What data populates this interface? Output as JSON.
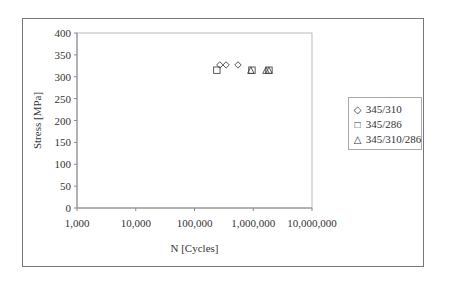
{
  "chart_data": {
    "type": "scatter",
    "title": "",
    "xlabel": "N [Cycles]",
    "ylabel": "Stress [MPa]",
    "xscale": "log",
    "xlim": [
      1000,
      10000000
    ],
    "ylim": [
      0,
      400
    ],
    "x_ticks": [
      "1,000",
      "10,000",
      "100,000",
      "1,000,000",
      "10,000,000"
    ],
    "y_ticks": [
      "0",
      "50",
      "100",
      "150",
      "200",
      "250",
      "300",
      "350",
      "400"
    ],
    "grid": false,
    "legend_position": "right",
    "series": [
      {
        "name": "345/310",
        "marker": "diamond",
        "points": [
          [
            270000,
            327
          ],
          [
            345000,
            327
          ],
          [
            550000,
            327
          ]
        ]
      },
      {
        "name": "345/286",
        "marker": "square",
        "points": [
          [
            240000,
            315
          ],
          [
            950000,
            315
          ],
          [
            1850000,
            315
          ]
        ]
      },
      {
        "name": "345/310/286",
        "marker": "triangle",
        "points": [
          [
            910000,
            315
          ],
          [
            1650000,
            315
          ],
          [
            1850000,
            315
          ]
        ]
      }
    ]
  },
  "legend": {
    "items": [
      {
        "symbol": "◇",
        "label": "345/310"
      },
      {
        "symbol": "□",
        "label": "345/286"
      },
      {
        "symbol": "△",
        "label": "345/310/286"
      }
    ]
  },
  "axes": {
    "xlabel": "N [Cycles]",
    "ylabel": "Stress [MPa]"
  }
}
